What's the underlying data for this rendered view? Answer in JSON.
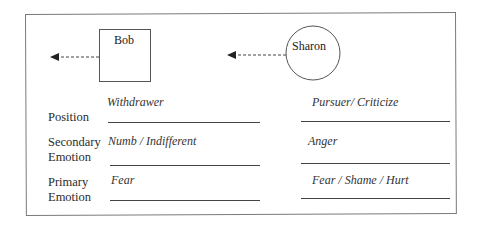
{
  "diagram": {
    "type": "couple-interaction-cycle",
    "persons": [
      {
        "name": "Bob",
        "shape": "square",
        "arrow": "dashed-left"
      },
      {
        "name": "Sharon",
        "shape": "circle",
        "arrow": "dashed-left"
      }
    ],
    "rows": [
      {
        "label_line1": "Position",
        "label_line2": "",
        "bob": "Withdrawer",
        "sharon": "Pursuer/ Criticize"
      },
      {
        "label_line1": "Secondary",
        "label_line2": "Emotion",
        "bob": "Numb / Indifferent",
        "sharon": "Anger"
      },
      {
        "label_line1": "Primary",
        "label_line2": "Emotion",
        "bob": "Fear",
        "sharon": "Fear / Shame / Hurt"
      }
    ],
    "colors": {
      "line": "#444444",
      "frame": "#7a7a7a",
      "text": "#2a2a2a"
    }
  }
}
